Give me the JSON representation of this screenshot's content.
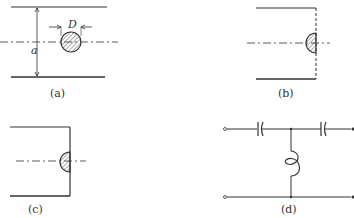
{
  "figure": {
    "panels": [
      {
        "id": "a",
        "caption": "(a)",
        "labels": {
          "diameter": "D",
          "height": "a"
        }
      },
      {
        "id": "b",
        "caption": "(b)"
      },
      {
        "id": "c",
        "caption": "(c)"
      },
      {
        "id": "d",
        "caption": "(d)"
      }
    ],
    "colors": {
      "line": "#333333",
      "hatch": "#555555",
      "background": "#ffffff"
    }
  }
}
